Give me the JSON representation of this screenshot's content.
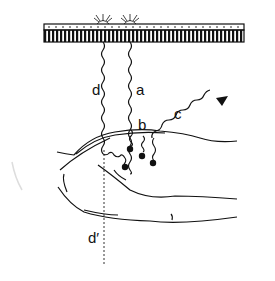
{
  "diagram": {
    "labels": {
      "a": "a",
      "b": "b",
      "c": "c",
      "d": "d",
      "d_prime": "d′"
    },
    "colors": {
      "ink": "#111111",
      "background": "#ffffff"
    }
  }
}
